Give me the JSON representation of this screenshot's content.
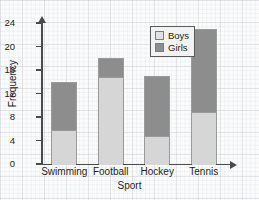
{
  "chart_data": {
    "type": "bar",
    "subtype": "stacked-bar",
    "title": "",
    "xlabel": "Sport",
    "ylabel": "Frequency",
    "categories": [
      "Swimming",
      "Football",
      "Hockey",
      "Tennis"
    ],
    "series": [
      {
        "name": "Boys",
        "color": "#d6d6d6",
        "values": [
          6,
          15,
          5,
          9
        ]
      },
      {
        "name": "Girls",
        "color": "#8d8d8d",
        "values": [
          8,
          3,
          10,
          14
        ]
      }
    ],
    "totals": [
      14,
      18,
      15,
      23
    ],
    "ylim": [
      0,
      24
    ],
    "ytick_labels": [
      "24",
      "20",
      "16",
      "12",
      "8",
      "4",
      "0"
    ],
    "ytick_values": [
      24,
      20,
      16,
      12,
      8,
      4,
      0
    ],
    "grid": true,
    "legend_position": "top-right",
    "legend_entries": [
      "Boys",
      "Girls"
    ]
  },
  "axes": {
    "y_title": "Frequency",
    "x_title": "Sport"
  },
  "colors": {
    "boys": "#d6d6d6",
    "girls": "#8d8d8d",
    "axis": "#4a4a4a",
    "grid": "#afb9c8",
    "text": "#231f20"
  }
}
